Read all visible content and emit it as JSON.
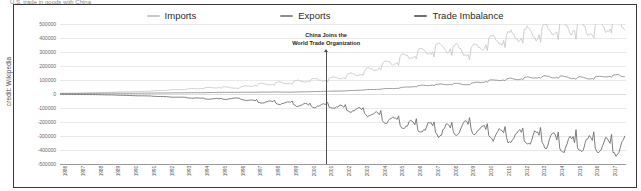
{
  "credit": "credit: Wikipedia",
  "top_sliver": "U.S. trade in goods with China",
  "annotation": {
    "line1": "China Joins the",
    "line2": "World Trade Organization",
    "at_year": 2001
  },
  "colors": {
    "imports": "#c9c9c9",
    "exports": "#8f8f8f",
    "imbalance": "#6f6f6f",
    "grid": "#e9e9e9",
    "border": "#3a3a3a",
    "axis": "#9a9a9a",
    "text": "#2b2b2b"
  },
  "legend": [
    {
      "label": "Imports",
      "color": "#c9c9c9"
    },
    {
      "label": "Exports",
      "color": "#8f8f8f"
    },
    {
      "label": "Trade Imbalance",
      "color": "#6f6f6f"
    }
  ],
  "chart_data": {
    "type": "line",
    "title": "",
    "xlabel": "",
    "ylabel": "",
    "grid": true,
    "legend_position": "top-center",
    "ylim": [
      -500000,
      500000
    ],
    "yticks": [
      500000,
      400000,
      300000,
      200000,
      100000,
      0,
      -100000,
      -200000,
      -300000,
      -400000,
      -500000
    ],
    "ytick_labels": [
      "500000",
      "400000",
      "300000",
      "200000",
      "100000",
      "0",
      "-100000",
      "-200000",
      "-300000",
      "-400000",
      "-500000"
    ],
    "xlim": [
      1986,
      2017.9
    ],
    "x": [
      1986,
      1987,
      1988,
      1989,
      1990,
      1991,
      1992,
      1993,
      1994,
      1995,
      1996,
      1997,
      1998,
      1999,
      2000,
      2001,
      2002,
      2003,
      2004,
      2005,
      2006,
      2007,
      2008,
      2009,
      2010,
      2011,
      2012,
      2013,
      2014,
      2015,
      2016,
      2017
    ],
    "xtick_labels": [
      "1986",
      "1987",
      "1988",
      "1989",
      "1990",
      "1991",
      "1992",
      "1993",
      "1994",
      "1995",
      "1996",
      "1997",
      "1998",
      "1999",
      "2000",
      "2001",
      "2002",
      "2003",
      "2004",
      "2005",
      "2006",
      "2007",
      "2008",
      "2009",
      "2010",
      "2011",
      "2012",
      "2013",
      "2014",
      "2015",
      "2016",
      "2017"
    ],
    "annotations": [
      {
        "text": "China Joins the World Trade Organization",
        "x": 2001,
        "y": 380000
      }
    ],
    "series": [
      {
        "name": "Imports",
        "color": "#c9c9c9",
        "values": [
          5200,
          7000,
          9500,
          12800,
          16300,
          20300,
          27400,
          33800,
          41400,
          48500,
          43500,
          65800,
          75100,
          81800,
          100100,
          102300,
          125200,
          152400,
          196700,
          243500,
          287800,
          321500,
          337800,
          296400,
          364900,
          399400,
          425600,
          440400,
          468500,
          483200,
          462800,
          505600
        ],
        "monthly_seasonal_amplitude_pct": 14
      },
      {
        "name": "Exports",
        "color": "#8f8f8f",
        "values": [
          3100,
          3500,
          5000,
          5800,
          4800,
          6300,
          7500,
          8800,
          9300,
          11700,
          12000,
          12900,
          14200,
          13100,
          16300,
          19200,
          22100,
          28400,
          34700,
          41800,
          55200,
          65200,
          71500,
          69600,
          91900,
          104100,
          110600,
          122000,
          124000,
          116200,
          115600,
          130400
        ],
        "monthly_seasonal_amplitude_pct": 8
      },
      {
        "name": "Trade Imbalance",
        "color": "#6f6f6f",
        "values": [
          -2100,
          -3500,
          -4500,
          -7000,
          -11500,
          -14000,
          -19900,
          -25000,
          -32100,
          -36800,
          -31500,
          -52900,
          -60900,
          -68700,
          -83800,
          -83100,
          -103100,
          -124000,
          -162000,
          -201700,
          -232600,
          -256300,
          -266300,
          -226800,
          -273000,
          -295300,
          -315000,
          -318400,
          -344500,
          -367000,
          -347200,
          -375200
        ],
        "monthly_seasonal_amplitude_pct": 22
      }
    ]
  }
}
